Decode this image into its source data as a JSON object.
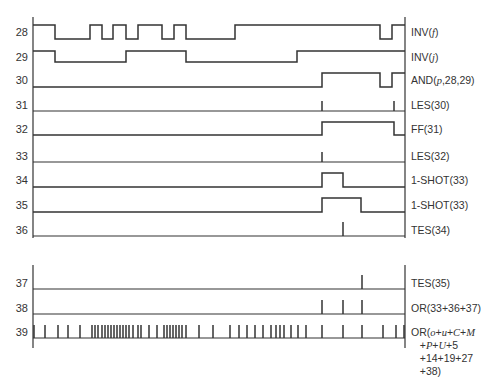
{
  "figure": {
    "type": "timing-diagram",
    "x_range": [
      33,
      405
    ],
    "axis_x_left": 33,
    "axis_x_right": 405,
    "line_color": "#333333"
  },
  "signals": [
    {
      "row": "28",
      "label": "INV(f)",
      "label_html": "INV(<i>f</i>)",
      "kind": "wave",
      "y_high": 25,
      "y_low": 39,
      "levels": [
        [
          33,
          1
        ],
        [
          55,
          0
        ],
        [
          90,
          1
        ],
        [
          102,
          0
        ],
        [
          113,
          1
        ],
        [
          126,
          0
        ],
        [
          138,
          1
        ],
        [
          162,
          0
        ],
        [
          174,
          1
        ],
        [
          186,
          0
        ],
        [
          235,
          1
        ],
        [
          380,
          0
        ],
        [
          392,
          1
        ],
        [
          405,
          1
        ]
      ]
    },
    {
      "row": "29",
      "label": "INV(j)",
      "label_html": "INV(<i>j</i>)",
      "kind": "wave",
      "y_high": 51,
      "y_low": 62,
      "levels": [
        [
          33,
          1
        ],
        [
          55,
          0
        ],
        [
          126,
          1
        ],
        [
          186,
          0
        ],
        [
          297,
          1
        ],
        [
          405,
          1
        ]
      ]
    },
    {
      "row": "30",
      "label": "AND(p,28,29)",
      "label_html": "AND(<i>p</i>,28,29)",
      "kind": "wave",
      "y_high": 73,
      "y_low": 87,
      "levels": [
        [
          33,
          0
        ],
        [
          322,
          1
        ],
        [
          380,
          0
        ],
        [
          392,
          1
        ],
        [
          405,
          1
        ]
      ]
    },
    {
      "row": "31",
      "label": "LES(30)",
      "label_html": "LES(30)",
      "kind": "pulses",
      "y_base": 111,
      "pulse_h": 10,
      "pulses": [
        322,
        394
      ]
    },
    {
      "row": "32",
      "label": "FF(31)",
      "label_html": "FF(31)",
      "kind": "wave",
      "y_high": 122,
      "y_low": 135,
      "levels": [
        [
          33,
          0
        ],
        [
          322,
          1
        ],
        [
          394,
          0
        ],
        [
          405,
          0
        ]
      ]
    },
    {
      "row": "33",
      "label": "LES(32)",
      "label_html": "LES(32)",
      "kind": "pulses",
      "y_base": 162,
      "pulse_h": 10,
      "pulses": [
        322
      ]
    },
    {
      "row": "34",
      "label": "1-SHOT(33)",
      "label_html": "1-SHOT(33)",
      "kind": "wave",
      "y_high": 173,
      "y_low": 187,
      "levels": [
        [
          33,
          0
        ],
        [
          322,
          1
        ],
        [
          343,
          0
        ],
        [
          405,
          0
        ]
      ]
    },
    {
      "row": "35",
      "label": "1-SHOT(33)",
      "label_html": "1-SHOT(33)",
      "kind": "wave",
      "y_high": 198,
      "y_low": 212,
      "levels": [
        [
          33,
          0
        ],
        [
          322,
          1
        ],
        [
          361,
          0
        ],
        [
          405,
          0
        ]
      ]
    },
    {
      "row": "36",
      "label": "TES(34)",
      "label_html": "TES(34)",
      "kind": "pulses",
      "y_base": 236,
      "pulse_h": 14,
      "pulses": [
        343
      ]
    },
    {
      "row": "37",
      "label": "TES(35)",
      "label_html": "TES(35)",
      "kind": "pulses",
      "y_base": 289,
      "pulse_h": 14,
      "pulses": [
        362
      ]
    },
    {
      "row": "38",
      "label": "OR(33+36+37)",
      "label_html": "OR(33+36+37)",
      "kind": "pulses",
      "y_base": 314,
      "pulse_h": 14,
      "pulses": [
        322,
        343,
        362
      ]
    },
    {
      "row": "39",
      "label": "OR(o+u+C+M +P+U+5 +14+19+27 +38)",
      "label_html": "OR(<i>o</i>+<i>u</i>+<i>C</i>+<i>M</i>\n   +<i>P</i>+<i>U</i>+5\n   +14+19+27\n   +38)",
      "kind": "pulses",
      "y_base": 338,
      "pulse_h": 13,
      "pulses": [
        34,
        45,
        58,
        68,
        80,
        92,
        95,
        98,
        102,
        105,
        108,
        111,
        114,
        117,
        120,
        123,
        126,
        129,
        133,
        138,
        141,
        149,
        157,
        164,
        167,
        170,
        173,
        176,
        179,
        182,
        186,
        199,
        213,
        230,
        239,
        247,
        255,
        263,
        271,
        276,
        280,
        284,
        291,
        298,
        306,
        322,
        343,
        362,
        383,
        396,
        404
      ]
    }
  ],
  "axes": {
    "top_block": {
      "x_left": 33,
      "x_right": 405,
      "y_top": 17,
      "y_bottom": 238
    },
    "bottom_block": {
      "x_left": 33,
      "x_right": 405,
      "y_top": 265,
      "y_bottom": 348
    }
  }
}
